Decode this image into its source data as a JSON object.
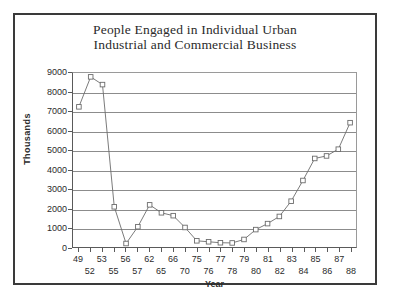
{
  "chart_data": {
    "type": "line",
    "title": "People Engaged in Individual Urban Industrial and Commercial Business",
    "title_lines": [
      "People Engaged in Individual Urban",
      "Industrial and Commercial Business"
    ],
    "xlabel": "Year",
    "ylabel": "Thousands",
    "ylim": [
      0,
      9000
    ],
    "ytick_labels": [
      "0",
      "1000",
      "2000",
      "3000",
      "4000",
      "5000",
      "6000",
      "7000",
      "8000",
      "9000"
    ],
    "yticks": [
      0,
      1000,
      2000,
      3000,
      4000,
      5000,
      6000,
      7000,
      8000,
      9000
    ],
    "grid": "horizontal",
    "legend": "none",
    "marker": "open-square",
    "line_color": "#6b6b6b",
    "marker_color": "#6b6b6b",
    "categories": [
      "49",
      "52",
      "53",
      "55",
      "56",
      "57",
      "62",
      "65",
      "66",
      "70",
      "75",
      "76",
      "77",
      "78",
      "79",
      "80",
      "81",
      "82",
      "83",
      "84",
      "85",
      "86",
      "87",
      "88"
    ],
    "values": [
      7250,
      8800,
      8400,
      2080,
      180,
      1050,
      2180,
      1770,
      1620,
      1010,
      320,
      270,
      220,
      210,
      390,
      900,
      1210,
      1580,
      2370,
      3440,
      4580,
      4710,
      5060,
      6430
    ],
    "categories_row_top": [
      "49",
      "53",
      "56",
      "62",
      "66",
      "75",
      "77",
      "79",
      "81",
      "83",
      "85",
      "87"
    ],
    "categories_row_bottom": [
      "52",
      "55",
      "57",
      "65",
      "70",
      "76",
      "78",
      "80",
      "82",
      "84",
      "86",
      "88"
    ]
  }
}
